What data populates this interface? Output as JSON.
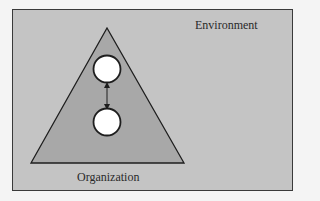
{
  "diagram": {
    "environment_label": "Environment",
    "organization_label": "Organization",
    "nodes": [
      {
        "id": "upper-node",
        "shape": "circle"
      },
      {
        "id": "lower-node",
        "shape": "circle"
      }
    ],
    "connector": {
      "type": "bidirectional-arrow",
      "from": "upper-node",
      "to": "lower-node"
    },
    "colors": {
      "environment_fill": "#c4c4c4",
      "organization_fill": "#a8a8a8",
      "node_fill": "#ffffff",
      "stroke": "#1e1e1e"
    }
  }
}
